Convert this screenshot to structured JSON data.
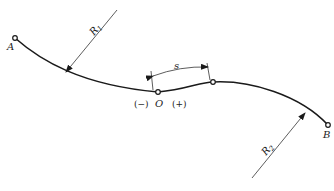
{
  "diagram": {
    "title": "",
    "labels": {
      "point_a": "A",
      "point_b": "B",
      "origin": "O",
      "radius_1": "R",
      "radius_1_sub": "1",
      "radius_2": "R",
      "radius_2_sub": "2",
      "arc_length": "s",
      "negative_side": "(−)",
      "positive_side": "(+)"
    },
    "colors": {
      "line": "#1a1a1a",
      "background": "#ffffff"
    }
  }
}
